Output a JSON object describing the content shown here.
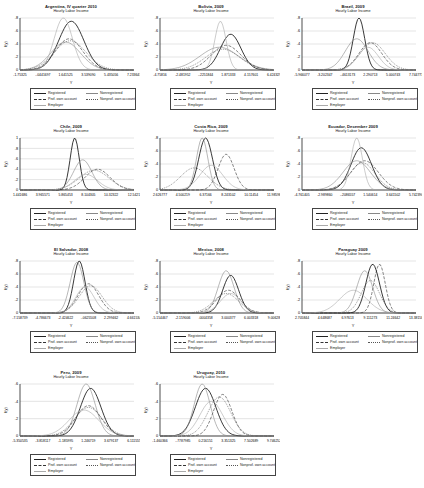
{
  "figure": {
    "subtitle": "Hourly Labor Income",
    "xlabel": "Y",
    "ylabel": "f(y)",
    "legend": [
      "Registered",
      "Nonregistered",
      "Prof. own account",
      "Nonprof. own account",
      "Employer"
    ],
    "series_styles": {
      "Registered": {
        "color": "#222222",
        "dash": "",
        "width": 0.9
      },
      "Nonregistered": {
        "color": "#888888",
        "dash": "",
        "width": 0.6
      },
      "Prof. own account": {
        "color": "#333333",
        "dash": "3,1.5",
        "width": 0.6
      },
      "Nonprof. own account": {
        "color": "#555555",
        "dash": "1,1",
        "width": 0.6
      },
      "Employer": {
        "color": "#aaaaaa",
        "dash": "",
        "width": 0.6
      }
    }
  },
  "chart_data": [
    {
      "type": "line",
      "title": "Argentina, IV quarter 2010",
      "ylim": [
        0,
        0.8
      ],
      "yticks": [
        "0",
        ".2",
        ".4",
        ".6",
        ".8"
      ],
      "xticks": [
        "-1.75325",
        "-.0441697",
        "1.641525",
        "3.539090",
        "5.435056",
        "7.233647"
      ],
      "series": [
        {
          "name": "Registered",
          "peak_x": 0.45,
          "peak": 0.75,
          "sd": 0.11
        },
        {
          "name": "Nonregistered",
          "peak_x": 0.4,
          "peak": 0.43,
          "sd": 0.13
        },
        {
          "name": "Prof. own account",
          "peak_x": 0.43,
          "peak": 0.48,
          "sd": 0.12
        },
        {
          "name": "Nonprof. own account",
          "peak_x": 0.44,
          "peak": 0.45,
          "sd": 0.14
        },
        {
          "name": "Employer",
          "peak_x": 0.38,
          "peak": 0.8,
          "sd": 0.08
        }
      ]
    },
    {
      "type": "line",
      "title": "Bolivia, 2009",
      "ylim": [
        0,
        0.8
      ],
      "yticks": [
        "0",
        ".2",
        ".4",
        ".6",
        ".8"
      ],
      "xticks": [
        "-4.75816",
        "-2.481952",
        "-.2251844",
        "1.871333",
        "4.157601",
        "6.424329"
      ],
      "series": [
        {
          "name": "Registered",
          "peak_x": 0.62,
          "peak": 0.55,
          "sd": 0.09
        },
        {
          "name": "Nonregistered",
          "peak_x": 0.52,
          "peak": 0.35,
          "sd": 0.17
        },
        {
          "name": "Prof. own account",
          "peak_x": 0.58,
          "peak": 0.38,
          "sd": 0.13
        },
        {
          "name": "Nonprof. own account",
          "peak_x": 0.55,
          "peak": 0.32,
          "sd": 0.15
        },
        {
          "name": "Employer",
          "peak_x": 0.53,
          "peak": 0.75,
          "sd": 0.05
        }
      ]
    },
    {
      "type": "line",
      "title": "Brazil, 2009",
      "ylim": [
        0,
        0.8
      ],
      "yticks": [
        "0",
        ".2",
        ".4",
        ".6",
        ".8"
      ],
      "xticks": [
        "-5.966077",
        "-3.202347",
        "-.4613173",
        "2.290713",
        "5.000743",
        "7.744773"
      ],
      "series": [
        {
          "name": "Registered",
          "peak_x": 0.5,
          "peak": 0.8,
          "sd": 0.05
        },
        {
          "name": "Nonregistered",
          "peak_x": 0.48,
          "peak": 0.48,
          "sd": 0.1
        },
        {
          "name": "Prof. own account",
          "peak_x": 0.6,
          "peak": 0.42,
          "sd": 0.1
        },
        {
          "name": "Nonprof. own account",
          "peak_x": 0.62,
          "peak": 0.42,
          "sd": 0.11
        },
        {
          "name": "Employer",
          "peak_x": 0.58,
          "peak": 0.35,
          "sd": 0.09
        }
      ]
    },
    {
      "type": "line",
      "title": "Chile, 2009",
      "ylim": [
        0,
        1
      ],
      "yticks": [
        "0",
        ".2",
        ".4",
        ".6",
        ".8",
        "1"
      ],
      "xticks": [
        "1.441686",
        "3.965571",
        "5.865453",
        "8.104305",
        "10.32322",
        "12.5421"
      ],
      "series": [
        {
          "name": "Registered",
          "peak_x": 0.48,
          "peak": 1.0,
          "sd": 0.04
        },
        {
          "name": "Nonregistered",
          "peak_x": 0.55,
          "peak": 0.58,
          "sd": 0.08
        },
        {
          "name": "Prof. own account",
          "peak_x": 0.68,
          "peak": 0.4,
          "sd": 0.11
        },
        {
          "name": "Nonprof. own account",
          "peak_x": 0.65,
          "peak": 0.38,
          "sd": 0.13
        },
        {
          "name": "Employer",
          "peak_x": 0.58,
          "peak": 0.3,
          "sd": 0.1
        }
      ]
    },
    {
      "type": "line",
      "title": "Costa Rica, 2009",
      "ylim": [
        0,
        0.8
      ],
      "yticks": [
        "0",
        ".2",
        ".4",
        ".6",
        ".8"
      ],
      "xticks": [
        "2.626777",
        "4.500219",
        "6.37166",
        "8.243102",
        "10.11454",
        "11.98598"
      ],
      "series": [
        {
          "name": "Registered",
          "peak_x": 0.4,
          "peak": 0.8,
          "sd": 0.06
        },
        {
          "name": "Nonregistered",
          "peak_x": 0.37,
          "peak": 0.8,
          "sd": 0.05
        },
        {
          "name": "Prof. own account",
          "peak_x": 0.58,
          "peak": 0.55,
          "sd": 0.07
        },
        {
          "name": "Nonprof. own account",
          "peak_x": 0.3,
          "peak": 0.34,
          "sd": 0.12
        },
        {
          "name": "Employer",
          "peak_x": 0.45,
          "peak": 0.38,
          "sd": 0.1
        }
      ]
    },
    {
      "type": "line",
      "title": "Ecuador, December 2009",
      "ylim": [
        0,
        0.8
      ],
      "yticks": [
        "0",
        ".2",
        ".4",
        ".6",
        ".8"
      ],
      "xticks": [
        "-4.761405",
        "-2.989860",
        "-.2086557",
        "1.540614",
        "3.641502",
        "5.742390"
      ],
      "series": [
        {
          "name": "Registered",
          "peak_x": 0.52,
          "peak": 0.65,
          "sd": 0.09
        },
        {
          "name": "Nonregistered",
          "peak_x": 0.48,
          "peak": 0.45,
          "sd": 0.12
        },
        {
          "name": "Prof. own account",
          "peak_x": 0.55,
          "peak": 0.45,
          "sd": 0.12
        },
        {
          "name": "Nonprof. own account",
          "peak_x": 0.53,
          "peak": 0.42,
          "sd": 0.11
        },
        {
          "name": "Employer",
          "peak_x": 0.48,
          "peak": 0.8,
          "sd": 0.05
        }
      ]
    },
    {
      "type": "line",
      "title": "El Salvador, 2008",
      "ylim": [
        0,
        0.8
      ],
      "yticks": [
        "0",
        ".2",
        ".4",
        ".6",
        ".8"
      ],
      "xticks": [
        "-7.158739",
        "-4.786673",
        "-2.424622",
        "-.0625508",
        "2.299462",
        "4.661534"
      ],
      "series": [
        {
          "name": "Registered",
          "peak_x": 0.52,
          "peak": 0.8,
          "sd": 0.05
        },
        {
          "name": "Nonregistered",
          "peak_x": 0.5,
          "peak": 0.78,
          "sd": 0.06
        },
        {
          "name": "Prof. own account",
          "peak_x": 0.6,
          "peak": 0.45,
          "sd": 0.09
        },
        {
          "name": "Nonprof. own account",
          "peak_x": 0.62,
          "peak": 0.42,
          "sd": 0.1
        },
        {
          "name": "Employer",
          "peak_x": 0.57,
          "peak": 0.4,
          "sd": 0.08
        }
      ]
    },
    {
      "type": "line",
      "title": "Mexico, 2008",
      "ylim": [
        0,
        0.8
      ],
      "yticks": [
        "0",
        ".2",
        ".4",
        ".6",
        ".8"
      ],
      "xticks": [
        "-5.154467",
        "-2.159006",
        ".0004358",
        "3.000377",
        "6.003318",
        "9.00628"
      ],
      "series": [
        {
          "name": "Registered",
          "peak_x": 0.62,
          "peak": 0.58,
          "sd": 0.07
        },
        {
          "name": "Nonregistered",
          "peak_x": 0.58,
          "peak": 0.65,
          "sd": 0.07
        },
        {
          "name": "Prof. own account",
          "peak_x": 0.6,
          "peak": 0.35,
          "sd": 0.1
        },
        {
          "name": "Nonprof. own account",
          "peak_x": 0.58,
          "peak": 0.3,
          "sd": 0.11
        },
        {
          "name": "Employer",
          "peak_x": 0.62,
          "peak": 0.3,
          "sd": 0.09
        }
      ]
    },
    {
      "type": "line",
      "title": "Paraguay 2009",
      "ylim": [
        0,
        0.8
      ],
      "yticks": [
        "0",
        ".2",
        ".4",
        ".6",
        ".8"
      ],
      "xticks": [
        "2.705844",
        "4.648687",
        "6.97613",
        "9.111273",
        "11.24642",
        "13.38158"
      ],
      "series": [
        {
          "name": "Registered",
          "peak_x": 0.62,
          "peak": 0.75,
          "sd": 0.06
        },
        {
          "name": "Nonregistered",
          "peak_x": 0.55,
          "peak": 0.65,
          "sd": 0.07
        },
        {
          "name": "Prof. own account",
          "peak_x": 0.68,
          "peak": 0.75,
          "sd": 0.05
        },
        {
          "name": "Nonprof. own account",
          "peak_x": 0.6,
          "peak": 0.5,
          "sd": 0.08
        },
        {
          "name": "Employer",
          "peak_x": 0.45,
          "peak": 0.35,
          "sd": 0.12
        }
      ]
    },
    {
      "type": "line",
      "title": "Peru, 2009",
      "ylim": [
        0,
        0.6
      ],
      "yticks": [
        "0",
        ".2",
        ".4",
        ".6"
      ],
      "xticks": [
        "-5.350535",
        "-3.818117",
        "-1.185995",
        "1.246719",
        "3.679137",
        "6.111555"
      ],
      "series": [
        {
          "name": "Registered",
          "peak_x": 0.62,
          "peak": 0.55,
          "sd": 0.09
        },
        {
          "name": "Nonregistered",
          "peak_x": 0.58,
          "peak": 0.6,
          "sd": 0.08
        },
        {
          "name": "Prof. own account",
          "peak_x": 0.6,
          "peak": 0.35,
          "sd": 0.11
        },
        {
          "name": "Nonprof. own account",
          "peak_x": 0.6,
          "peak": 0.33,
          "sd": 0.12
        },
        {
          "name": "Employer",
          "peak_x": 0.56,
          "peak": 0.3,
          "sd": 0.13
        }
      ]
    },
    {
      "type": "line",
      "title": "Uruguay, 2010",
      "ylim": [
        0,
        0.6
      ],
      "yticks": [
        "0",
        ".2",
        ".4",
        ".6"
      ],
      "xticks": [
        "-1.460366",
        "-.7787985",
        "0.216151",
        "3.351325",
        "7.502689",
        "9.746252"
      ],
      "series": [
        {
          "name": "Registered",
          "peak_x": 0.4,
          "peak": 0.55,
          "sd": 0.09
        },
        {
          "name": "Nonregistered",
          "peak_x": 0.37,
          "peak": 0.6,
          "sd": 0.07
        },
        {
          "name": "Prof. own account",
          "peak_x": 0.55,
          "peak": 0.48,
          "sd": 0.08
        },
        {
          "name": "Nonprof. own account",
          "peak_x": 0.52,
          "peak": 0.45,
          "sd": 0.1
        },
        {
          "name": "Employer",
          "peak_x": 0.45,
          "peak": 0.4,
          "sd": 0.1
        }
      ]
    }
  ]
}
